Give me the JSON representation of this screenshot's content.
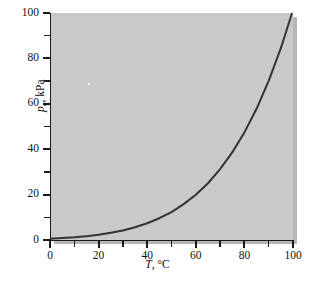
{
  "chart_data": {
    "type": "line",
    "title": "",
    "subtitle": "",
    "xlabel_symbol": "T",
    "xlabel_rest": ", °C",
    "xlabel": "T, °C",
    "ylabel_symbol": "p",
    "ylabel_subscript": "v",
    "ylabel_rest": ", kPa",
    "ylabel": "p_v, kPa",
    "xlim": [
      0,
      100
    ],
    "ylim": [
      0,
      100
    ],
    "grid": false,
    "legend": null,
    "legend_position": "none",
    "x_major_ticks": [
      0,
      20,
      40,
      60,
      80,
      100
    ],
    "x_minor_ticks": [
      10,
      30,
      50,
      70,
      90
    ],
    "y_major_ticks": [
      0,
      20,
      40,
      60,
      80,
      100
    ],
    "y_minor_ticks": [
      10,
      30,
      50,
      70,
      90
    ],
    "x_ticklabels": [
      "0",
      "20",
      "40",
      "60",
      "80",
      "100"
    ],
    "y_ticklabels": [
      "0",
      "20",
      "40",
      "60",
      "80",
      "100"
    ],
    "series": [
      {
        "name": "saturation vapor pressure of water",
        "color": "#333333",
        "linewidth": 2,
        "x": [
          0,
          5,
          10,
          15,
          20,
          25,
          30,
          35,
          40,
          45,
          50,
          55,
          60,
          65,
          70,
          75,
          80,
          85,
          90,
          95,
          100
        ],
        "values": [
          0.6,
          0.9,
          1.2,
          1.7,
          2.3,
          3.2,
          4.2,
          5.6,
          7.4,
          9.6,
          12.3,
          15.8,
          19.9,
          25.0,
          31.2,
          38.6,
          47.4,
          57.8,
          70.1,
          84.5,
          101.3
        ]
      }
    ],
    "colors": {
      "plot_background": "#c9c9c9",
      "figure_background": "#ffffff",
      "axis": "#1a1a1a",
      "curve": "#333333",
      "text": "#111111",
      "shadow": "#b6b6b6"
    }
  }
}
